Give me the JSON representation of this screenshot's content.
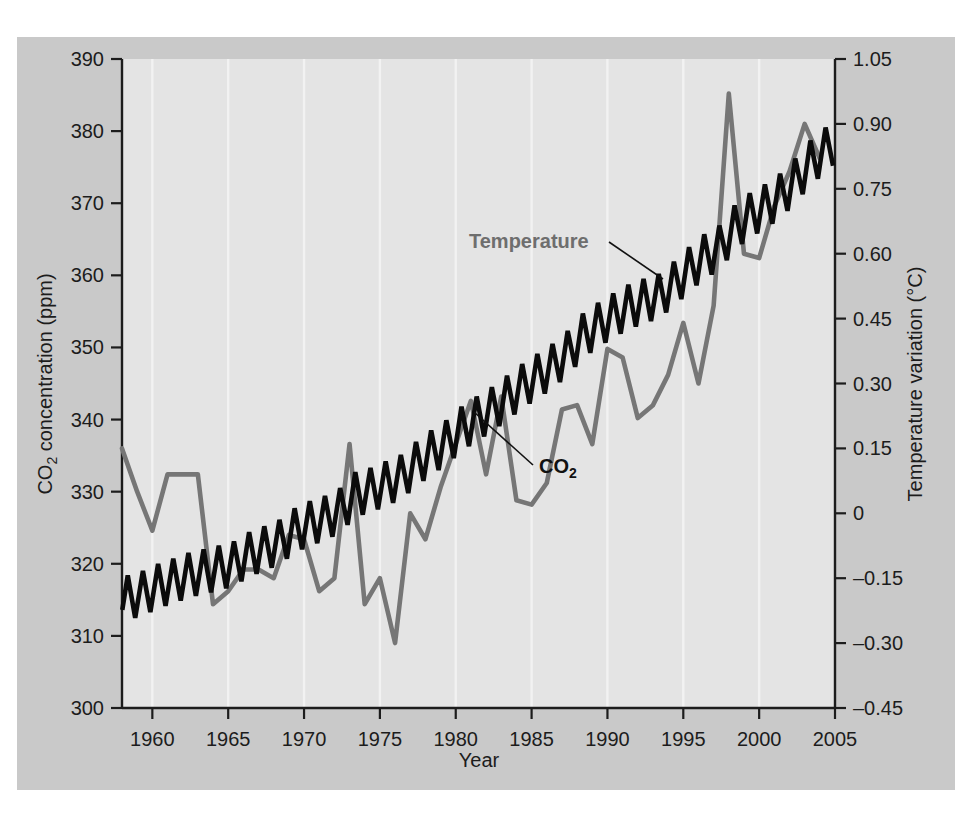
{
  "figure": {
    "background_color": "#c9c9c9",
    "plot_background_color": "#e4e4e4",
    "co2_color": "#0b0b0b",
    "temperature_color": "#767676",
    "gridline_color": "#f2f2f2"
  },
  "labels": {
    "temperature_annotation": "Temperature",
    "co2_annotation_main": "CO",
    "co2_annotation_sub": "2",
    "ylabel_left_main": "CO",
    "ylabel_left_sub": "2",
    "ylabel_left_rest": " concentration (ppm)",
    "ylabel_right": "Temperature variation (°C)",
    "xlabel": "Year"
  },
  "chart_data": {
    "type": "line",
    "title": "",
    "xlabel": "Year",
    "ylabel": "CO2 concentration (ppm)",
    "ylabel_right": "Temperature variation (°C)",
    "xlim": [
      1958,
      2005
    ],
    "ylim": [
      300,
      390
    ],
    "ylim_right": [
      -0.45,
      1.05
    ],
    "xticks": [
      1960,
      1965,
      1970,
      1975,
      1980,
      1985,
      1990,
      1995,
      2000,
      2005
    ],
    "xticklabels": [
      "1960",
      "1965",
      "1970",
      "1975",
      "1980",
      "1985",
      "1990",
      "1995",
      "2000",
      "2005"
    ],
    "yticks": [
      300,
      310,
      320,
      330,
      340,
      350,
      360,
      370,
      380,
      390
    ],
    "yticklabels": [
      "300",
      "310",
      "320",
      "330",
      "340",
      "350",
      "360",
      "370",
      "380",
      "390"
    ],
    "yticks_right": [
      -0.45,
      -0.3,
      -0.15,
      0,
      0.15,
      0.3,
      0.45,
      0.6,
      0.75,
      0.9,
      1.05
    ],
    "yticklabels_right": [
      "–0.45",
      "–0.30",
      "–0.15",
      "0",
      "0.15",
      "0.30",
      "0.45",
      "0.60",
      "0.75",
      "0.90",
      "1.05"
    ],
    "grid": "vertical-only",
    "legend_position": "inline-annotations",
    "series": [
      {
        "name": "CO2",
        "axis": "left",
        "units": "ppm",
        "color": "#0b0b0b",
        "note": "monthly Mauna Loa sawtooth; annual mean with seasonal amplitude ~3 ppm peak-to-peak",
        "annual_mean_x": [
          1958,
          1959,
          1960,
          1961,
          1962,
          1963,
          1964,
          1965,
          1966,
          1967,
          1968,
          1969,
          1970,
          1971,
          1972,
          1973,
          1974,
          1975,
          1976,
          1977,
          1978,
          1979,
          1980,
          1981,
          1982,
          1983,
          1984,
          1985,
          1986,
          1987,
          1988,
          1989,
          1990,
          1991,
          1992,
          1993,
          1994,
          1995,
          1996,
          1997,
          1998,
          1999,
          2000,
          2001,
          2002,
          2003,
          2004
        ],
        "annual_mean_y": [
          315.3,
          315.9,
          316.9,
          317.6,
          318.4,
          318.9,
          319.4,
          320.0,
          321.3,
          322.1,
          323.0,
          324.6,
          325.6,
          326.3,
          327.4,
          329.6,
          330.2,
          331.1,
          332.0,
          333.8,
          335.4,
          336.8,
          338.7,
          340.1,
          341.4,
          343.0,
          344.6,
          346.0,
          347.4,
          349.2,
          351.6,
          353.1,
          354.4,
          355.6,
          356.4,
          357.1,
          358.8,
          360.8,
          362.6,
          363.8,
          366.6,
          368.3,
          369.5,
          371.0,
          373.1,
          375.6,
          377.4
        ]
      },
      {
        "name": "Temperature",
        "axis": "right",
        "units": "°C",
        "color": "#767676",
        "note": "global annual temperature variation anomaly",
        "x": [
          1958,
          1959,
          1960,
          1961,
          1962,
          1963,
          1964,
          1965,
          1966,
          1967,
          1968,
          1969,
          1970,
          1971,
          1972,
          1973,
          1974,
          1975,
          1976,
          1977,
          1978,
          1979,
          1980,
          1981,
          1982,
          1983,
          1984,
          1985,
          1986,
          1987,
          1988,
          1989,
          1990,
          1991,
          1992,
          1993,
          1994,
          1995,
          1996,
          1997,
          1998,
          1999,
          2000,
          2001,
          2002,
          2003,
          2004
        ],
        "y": [
          0.15,
          0.05,
          -0.04,
          0.09,
          0.09,
          0.09,
          -0.21,
          -0.18,
          -0.13,
          -0.13,
          -0.15,
          -0.05,
          -0.06,
          -0.18,
          -0.15,
          0.16,
          -0.21,
          -0.15,
          -0.3,
          0.0,
          -0.06,
          0.06,
          0.16,
          0.26,
          0.09,
          0.27,
          0.03,
          0.02,
          0.07,
          0.24,
          0.25,
          0.16,
          0.38,
          0.36,
          0.22,
          0.25,
          0.32,
          0.44,
          0.3,
          0.48,
          0.97,
          0.6,
          0.59,
          0.71,
          0.79,
          0.9,
          0.82
        ]
      }
    ],
    "annotations": [
      {
        "text": "Temperature",
        "points_to_series": "Temperature",
        "points_to_x": 1991,
        "color": "#6e6e6e"
      },
      {
        "text": "CO2",
        "points_to_series": "CO2",
        "points_to_x": 1986,
        "color": "#111111"
      }
    ]
  }
}
